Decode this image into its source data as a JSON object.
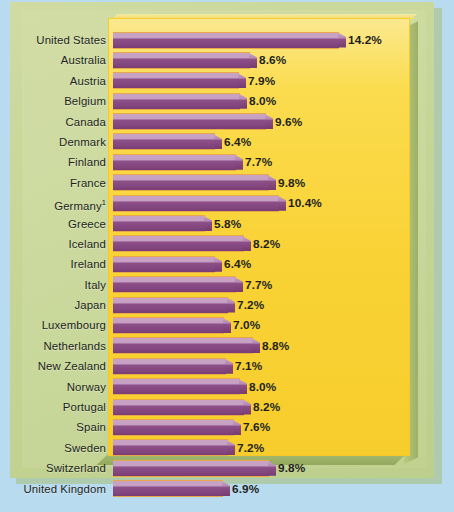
{
  "chart_data": {
    "type": "bar",
    "orientation": "horizontal",
    "title": "",
    "subtitle": "",
    "xlabel": "",
    "ylabel": "",
    "xlim": [
      0,
      14.2
    ],
    "grid": false,
    "legend": null,
    "value_suffix": "%",
    "footnote_marker": "1",
    "categories": [
      "United States",
      "Australia",
      "Austria",
      "Belgium",
      "Canada",
      "Denmark",
      "Finland",
      "France",
      "Germany",
      "Greece",
      "Iceland",
      "Ireland",
      "Italy",
      "Japan",
      "Luxembourg",
      "Netherlands",
      "New Zealand",
      "Norway",
      "Portugal",
      "Spain",
      "Sweden",
      "Switzerland",
      "United Kingdom"
    ],
    "values": [
      14.2,
      8.6,
      7.9,
      8.0,
      9.6,
      6.4,
      7.7,
      9.8,
      10.4,
      5.8,
      8.2,
      6.4,
      7.7,
      7.2,
      7.0,
      8.8,
      7.1,
      8.0,
      8.2,
      7.6,
      7.2,
      9.8,
      6.9
    ],
    "value_labels": [
      "14.2%",
      "8.6%",
      "7.9%",
      "8.0%",
      "9.6%",
      "6.4%",
      "7.7%",
      "9.8%",
      "10.4%",
      "5.8%",
      "8.2%",
      "6.4%",
      "7.7%",
      "7.2%",
      "7.0%",
      "8.8%",
      "7.1%",
      "8.0%",
      "8.2%",
      "7.6%",
      "7.2%",
      "9.8%",
      "6.9%"
    ],
    "rows": [
      {
        "label": "United States",
        "value": 14.2,
        "value_label": "14.2%",
        "footnote": ""
      },
      {
        "label": "Australia",
        "value": 8.6,
        "value_label": "8.6%",
        "footnote": ""
      },
      {
        "label": "Austria",
        "value": 7.9,
        "value_label": "7.9%",
        "footnote": ""
      },
      {
        "label": "Belgium",
        "value": 8.0,
        "value_label": "8.0%",
        "footnote": ""
      },
      {
        "label": "Canada",
        "value": 9.6,
        "value_label": "9.6%",
        "footnote": ""
      },
      {
        "label": "Denmark",
        "value": 6.4,
        "value_label": "6.4%",
        "footnote": ""
      },
      {
        "label": "Finland",
        "value": 7.7,
        "value_label": "7.7%",
        "footnote": ""
      },
      {
        "label": "France",
        "value": 9.8,
        "value_label": "9.8%",
        "footnote": ""
      },
      {
        "label": "Germany",
        "value": 10.4,
        "value_label": "10.4%",
        "footnote": "1"
      },
      {
        "label": "Greece",
        "value": 5.8,
        "value_label": "5.8%",
        "footnote": ""
      },
      {
        "label": "Iceland",
        "value": 8.2,
        "value_label": "8.2%",
        "footnote": ""
      },
      {
        "label": "Ireland",
        "value": 6.4,
        "value_label": "6.4%",
        "footnote": ""
      },
      {
        "label": "Italy",
        "value": 7.7,
        "value_label": "7.7%",
        "footnote": ""
      },
      {
        "label": "Japan",
        "value": 7.2,
        "value_label": "7.2%",
        "footnote": ""
      },
      {
        "label": "Luxembourg",
        "value": 7.0,
        "value_label": "7.0%",
        "footnote": ""
      },
      {
        "label": "Netherlands",
        "value": 8.8,
        "value_label": "8.8%",
        "footnote": ""
      },
      {
        "label": "New Zealand",
        "value": 7.1,
        "value_label": "7.1%",
        "footnote": ""
      },
      {
        "label": "Norway",
        "value": 8.0,
        "value_label": "8.0%",
        "footnote": ""
      },
      {
        "label": "Portugal",
        "value": 8.2,
        "value_label": "8.2%",
        "footnote": ""
      },
      {
        "label": "Spain",
        "value": 7.6,
        "value_label": "7.6%",
        "footnote": ""
      },
      {
        "label": "Sweden",
        "value": 7.2,
        "value_label": "7.2%",
        "footnote": ""
      },
      {
        "label": "Switzerland",
        "value": 9.8,
        "value_label": "9.8%",
        "footnote": ""
      },
      {
        "label": "United Kingdom",
        "value": 6.9,
        "value_label": "6.9%",
        "footnote": ""
      }
    ]
  },
  "colors": {
    "page_background": "#b9dbef",
    "panel_green": "#c8d79a",
    "plot_yellow": "#f9d235",
    "bar_light": "#c6a0c2",
    "bar_dark": "#8c4f87",
    "bar_outline": "#e8a84a",
    "text": "#231f20"
  },
  "caption_ghost": ""
}
